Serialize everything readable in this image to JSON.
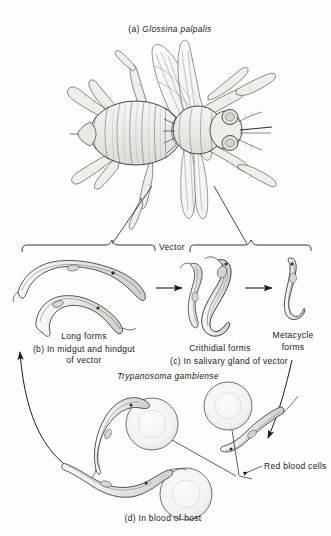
{
  "figure": {
    "title_label": "(a) Glossina palpalis",
    "title_prefix": "(a)",
    "title_species": "Glossina palpalis",
    "vector_label": "Vector",
    "parasite_species": "Trypanosoma gambiense",
    "stages": [
      {
        "id": "long-forms",
        "name": "Long forms",
        "caption_prefix": "(b)",
        "caption": "(b) In midgut and hindgut of vector",
        "caption_line1": "(b) In midgut and hindgut",
        "caption_line2": "of vector"
      },
      {
        "id": "crithidial-forms",
        "name": "Crithidial forms",
        "caption_prefix": "(c)",
        "caption": "(c) In salivary gland of vector"
      },
      {
        "id": "metacycle-forms",
        "name_line1": "Metacycle",
        "name_line2": "forms",
        "name": "Metacycle forms"
      },
      {
        "id": "blood-forms",
        "caption_prefix": "(d)",
        "caption": "(d) In blood of host",
        "annotation": "Red blood cells"
      }
    ],
    "colors": {
      "ink": "#1a1a1a",
      "line": "#2b2b2b",
      "background": "#fdfdfc",
      "cell_fill": "#f7f7f5"
    }
  }
}
